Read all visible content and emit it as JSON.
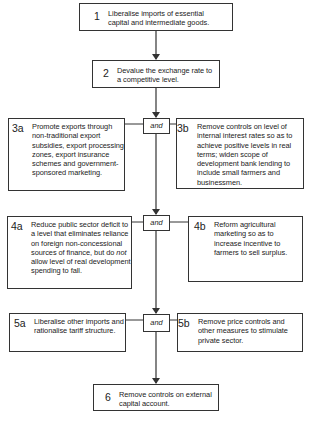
{
  "diagram": {
    "type": "flowchart",
    "colors": {
      "line": "#333333",
      "text": "#222222",
      "background": "#ffffff"
    },
    "connector_label": "and",
    "steps": {
      "s1": {
        "number": "1",
        "text": "Liberalise imports of essential capital and intermediate goods."
      },
      "s2": {
        "number": "2",
        "text": "Devalue the exchange rate to a competitive level."
      },
      "s3a": {
        "number": "3a",
        "text": "Promote exports through non-traditional export subsidies, export processing zones, export insurance schemes and government-sponsored marketing."
      },
      "s3b": {
        "number": "3b",
        "text": "Remove controls on level of internal interest rates so as to achieve positive levels in real terms; widen scope of development bank lending to include small farmers and businessmen."
      },
      "s4a": {
        "number": "4a",
        "text_before": "Reduce public sector deficit to a level that eliminates reliance on foreign non-concessional sources of finance, but do ",
        "text_emph": "not",
        "text_after": " allow level of real development spending to fall."
      },
      "s4b": {
        "number": "4b",
        "text": "Reform agricultural marketing so as to increase incentive to farmers to sell surplus."
      },
      "s5a": {
        "number": "5a",
        "text": "Liberalise other imports and rationalise tariff structure."
      },
      "s5b": {
        "number": "5b",
        "text": "Remove price controls and other measures to stimulate private sector."
      },
      "s6": {
        "number": "6",
        "text": "Remove controls on external capital account."
      }
    },
    "edges": [
      {
        "from": "1",
        "to": "2"
      },
      {
        "from": "2",
        "to": "and-3"
      },
      {
        "from": "3a",
        "to": "and-3"
      },
      {
        "from": "3b",
        "to": "and-3"
      },
      {
        "from": "and-3",
        "to": "and-4"
      },
      {
        "from": "4a",
        "to": "and-4"
      },
      {
        "from": "4b",
        "to": "and-4"
      },
      {
        "from": "and-4",
        "to": "and-5"
      },
      {
        "from": "5a",
        "to": "and-5"
      },
      {
        "from": "5b",
        "to": "and-5"
      },
      {
        "from": "and-5",
        "to": "6"
      }
    ]
  }
}
